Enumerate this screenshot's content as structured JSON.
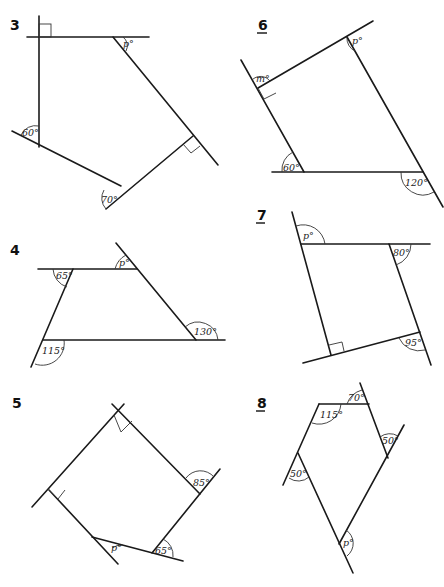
{
  "problems": [
    {
      "number": "3",
      "underlined": false,
      "angles": [
        "p°",
        "60°",
        "70°"
      ],
      "right_angles": 2
    },
    {
      "number": "6",
      "underlined": true,
      "angles": [
        "m°",
        "p°",
        "60°",
        "120°"
      ],
      "right_angles": 1
    },
    {
      "number": "4",
      "underlined": false,
      "angles": [
        "65°",
        "p°",
        "130°",
        "115°"
      ],
      "right_angles": 0
    },
    {
      "number": "7",
      "underlined": true,
      "angles": [
        "p°",
        "80°",
        "95°"
      ],
      "right_angles": 1
    },
    {
      "number": "5",
      "underlined": false,
      "angles": [
        "85°",
        "p°",
        "65°"
      ],
      "right_angles": 2
    },
    {
      "number": "8",
      "underlined": true,
      "angles": [
        "115°",
        "70°",
        "50°",
        "50°",
        "p°"
      ],
      "right_angles": 0
    }
  ]
}
